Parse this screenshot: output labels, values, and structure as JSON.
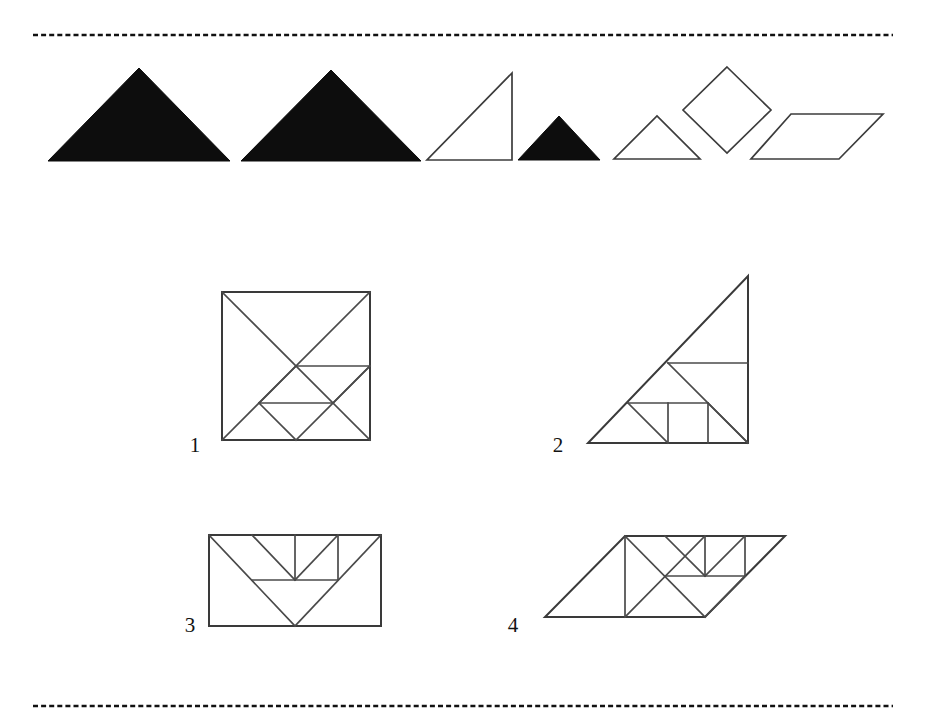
{
  "page": {
    "background_color": "#ffffff",
    "ink_color": "#111111",
    "outline_color": "#3c3c3c",
    "fill_color": "#0d0d0d",
    "width": 926,
    "height": 723,
    "caption": ""
  },
  "rules": {
    "top": {
      "name": "top-dashed-rule",
      "x1": 33,
      "y1": 35,
      "x2": 893,
      "y2": 35
    },
    "bottom": {
      "name": "bottom-dashed-rule",
      "x1": 33,
      "y1": 706,
      "x2": 893,
      "y2": 706
    }
  },
  "pieces_row": {
    "label": "tangram-pieces",
    "count": 7,
    "pieces": [
      {
        "id": "large-triangle-1",
        "type": "triangle",
        "fill": "solid",
        "points": "48,161 230,161 139,68"
      },
      {
        "id": "large-triangle-2",
        "type": "triangle",
        "fill": "solid",
        "points": "241,161 421,161 331,70"
      },
      {
        "id": "medium-triangle",
        "type": "right-triangle",
        "fill": "outline",
        "points": "427,160 512,160 512,73"
      },
      {
        "id": "small-triangle-1",
        "type": "triangle",
        "fill": "solid",
        "points": "518,160 600,160 559,116"
      },
      {
        "id": "small-triangle-2",
        "type": "triangle",
        "fill": "outline",
        "points": "614,159 700,159 657,116"
      },
      {
        "id": "square",
        "type": "square-rotated",
        "fill": "outline",
        "points": "727,67 771,110 727,153 683,110"
      },
      {
        "id": "parallelogram",
        "type": "parallelogram",
        "fill": "outline",
        "points": "791,114 883,114 839,159 751,159"
      }
    ]
  },
  "assemblies": [
    {
      "id": "assembly-1",
      "label": "1",
      "shape_name": "square",
      "label_x": 195,
      "label_y": 452,
      "outline": "222,292 370,292 370,440 222,440",
      "seams": [
        "M 222,292 L 333,403",
        "M 370,292 L 259,403",
        "M 296,366 L 370,366",
        "M 370,366 L 333,403",
        "M 259,403 L 333,403",
        "M 222,440 L 296,366",
        "M 296,440 L 370,366",
        "M 259,403 L 296,440",
        "M 333,403 L 370,440"
      ]
    },
    {
      "id": "assembly-2",
      "label": "2",
      "shape_name": "right-triangle",
      "label_x": 558,
      "label_y": 452,
      "outline": "588,443 748,443 748,276",
      "seams": [
        "M 668,363 L 748,363",
        "M 668,363 L 748,443",
        "M 628,403 L 708,403",
        "M 628,403 L 668,443",
        "M 668,403 L 668,443",
        "M 708,403 L 708,443",
        "M 708,403 L 748,443"
      ]
    },
    {
      "id": "assembly-3",
      "label": "3",
      "shape_name": "rectangle",
      "label_x": 190,
      "label_y": 632,
      "outline": "209,535 381,535 381,626 209,626",
      "seams": [
        "M 209,535 L 295,626",
        "M 381,535 L 295,626",
        "M 252,580 L 338,580",
        "M 252,535 L 295,580",
        "M 295,535 L 295,580",
        "M 338,535 L 338,580",
        "M 338,535 L 295,580"
      ]
    },
    {
      "id": "assembly-4",
      "label": "4",
      "shape_name": "parallelogram",
      "label_x": 513,
      "label_y": 632,
      "outline": "545,617 705,617 785,536 625,536",
      "seams": [
        "M 625,536 L 705,617",
        "M 625,536 L 625,617",
        "M 705,536 L 625,617",
        "M 705,617 L 745,576",
        "M 665,576 L 745,576",
        "M 665,536 L 705,576",
        "M 705,536 L 705,576",
        "M 745,536 L 745,576",
        "M 745,536 L 705,576"
      ]
    }
  ]
}
